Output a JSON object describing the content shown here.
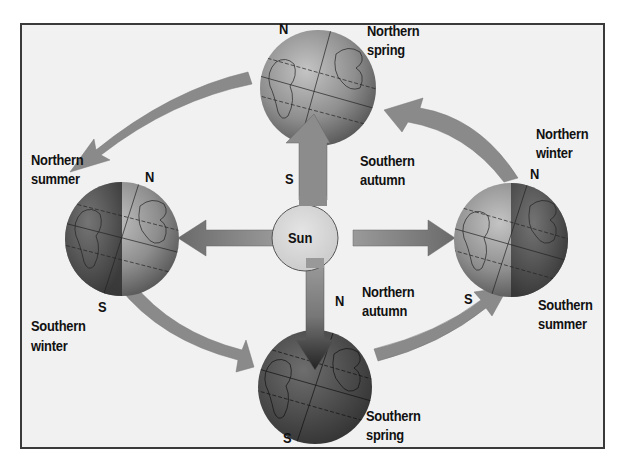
{
  "diagram": {
    "sun": {
      "label": "Sun",
      "color": "#d9d9d9"
    },
    "globes": [
      {
        "id": "top",
        "north_label": "N",
        "south_label": "S",
        "season_north": "Northern spring",
        "season_south": "Southern autumn"
      },
      {
        "id": "left",
        "north_label": "N",
        "south_label": "S",
        "season_north": "Northern summer",
        "season_south": "Southern winter"
      },
      {
        "id": "bottom",
        "north_label": "N",
        "south_label": "S",
        "season_north": "Northern autumn",
        "season_south": "Southern spring"
      },
      {
        "id": "right",
        "north_label": "N",
        "south_label": "S",
        "season_north": "Northern winter",
        "season_south": "Southern summer"
      }
    ],
    "labels": {
      "top_n1": "Northern",
      "top_n2": "spring",
      "top_s1": "Southern",
      "top_s2": "autumn",
      "left_n1": "Northern",
      "left_n2": "summer",
      "left_s1": "Southern",
      "left_s2": "winter",
      "bottom_n1": "Northern",
      "bottom_n2": "autumn",
      "bottom_s1": "Southern",
      "bottom_s2": "spring",
      "right_n1": "Northern",
      "right_n2": "winter",
      "right_s1": "Southern",
      "right_s2": "summer",
      "n": "N",
      "s": "S"
    },
    "colors": {
      "background": "#f1f1f1",
      "frame": "#3a3a3a",
      "arrow": "#8a8a8a",
      "globe_light": "#9a9a9a",
      "globe_dark": "#4a4a4a"
    }
  }
}
